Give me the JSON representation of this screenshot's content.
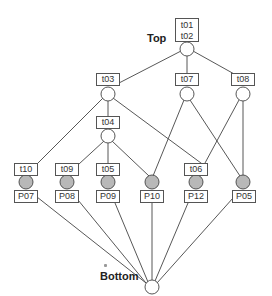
{
  "diagram": {
    "top_label": "Top",
    "bottom_label": "Bottom",
    "colors": {
      "line": "#444444",
      "empty_node": "#ffffff",
      "filled_node": "#b8b8b8",
      "border": "#555555"
    },
    "top_node": {
      "labels": [
        "t01",
        "t02"
      ]
    },
    "level1": [
      {
        "label": "t03"
      },
      {
        "label": "t07"
      },
      {
        "label": "t08"
      }
    ],
    "level2": [
      {
        "label": "t04"
      }
    ],
    "bottom_row": [
      {
        "top": "t10",
        "bottom": "P07"
      },
      {
        "top": "t09",
        "bottom": "P08"
      },
      {
        "top": "t05",
        "bottom": "P09"
      },
      {
        "top": "",
        "bottom": "P10"
      },
      {
        "top": "t06",
        "bottom": "P12"
      },
      {
        "top": "",
        "bottom": "P05"
      }
    ]
  }
}
